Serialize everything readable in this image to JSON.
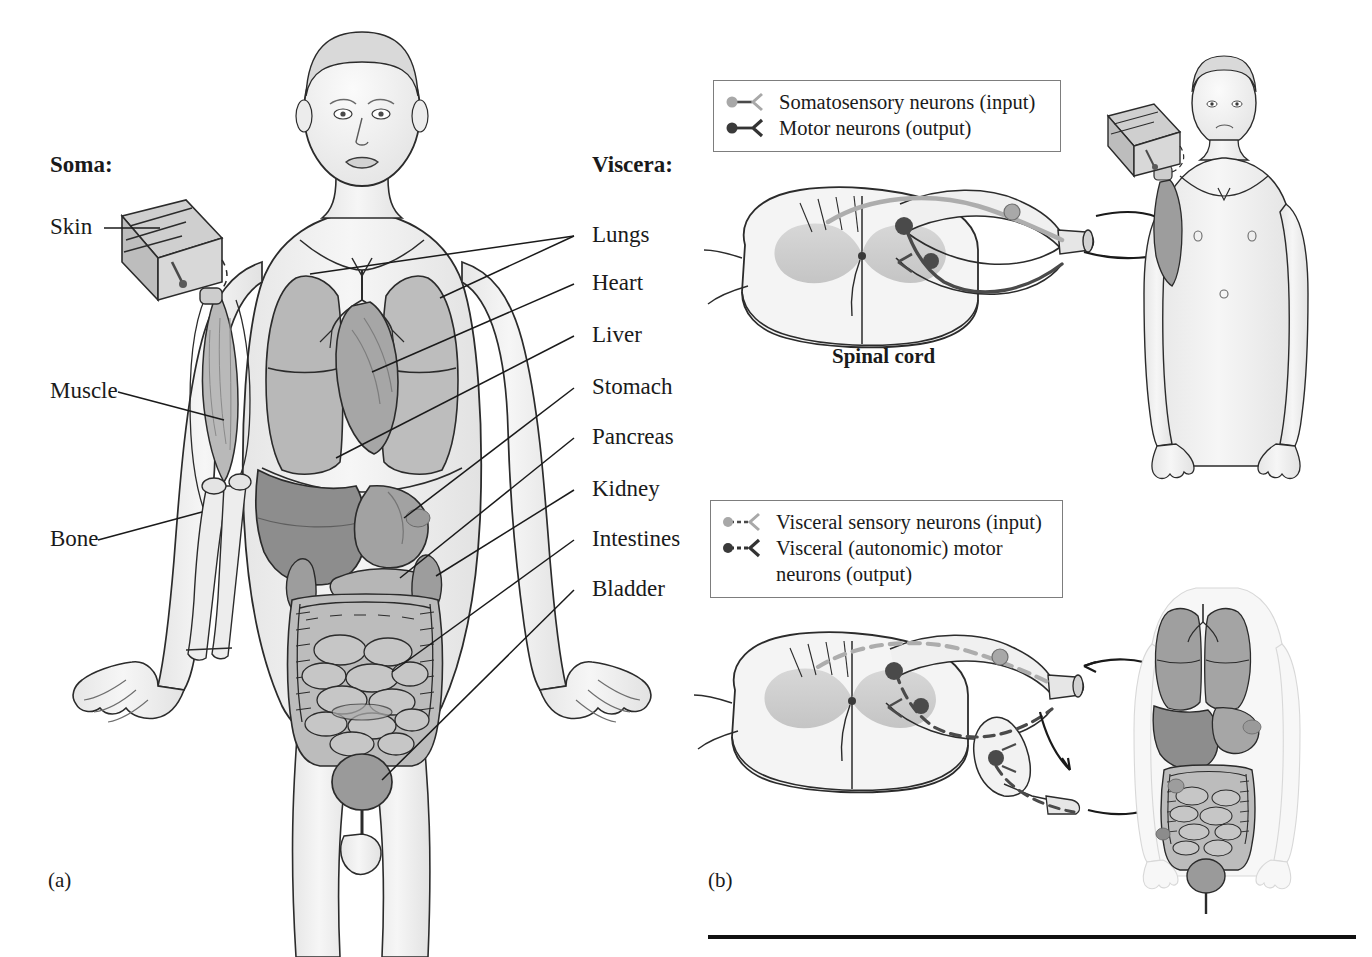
{
  "figure": {
    "panel_a": {
      "id": "(a)",
      "left_heading": "Soma:",
      "left_labels": [
        "Skin",
        "Muscle",
        "Bone"
      ],
      "right_heading": "Viscera:",
      "right_labels": [
        "Lungs",
        "Heart",
        "Liver",
        "Stomach",
        "Pancreas",
        "Kidney",
        "Intestines",
        "Bladder"
      ]
    },
    "panel_b": {
      "id": "(b)",
      "spinal_cord_label": "Spinal cord",
      "legend_top": {
        "rows": [
          {
            "key": "light-dot-solid-line",
            "text": "Somatosensory neurons (input)"
          },
          {
            "key": "dark-dot-solid-line",
            "text": "Motor neurons (output)"
          }
        ]
      },
      "legend_bottom": {
        "rows": [
          {
            "key": "light-dot-dashed-line",
            "text": "Visceral sensory neurons (input)"
          },
          {
            "key": "dark-dot-dashed-line",
            "text": "Visceral (autonomic) motor\nneurons (output)"
          }
        ]
      }
    }
  },
  "colors": {
    "ink": "#1a1a1a",
    "outline": "#2b2b2b",
    "body_fill": "#f2f2f2",
    "body_shade": "#e0e0e0",
    "organ_light": "#c9c9c9",
    "organ_mid": "#b0b0b0",
    "organ_dark": "#8f8f8f",
    "neuron_light": "#a8a8a8",
    "neuron_dark": "#4a4a4a",
    "legend_border": "#7d7d7d",
    "rule": "#111111"
  }
}
